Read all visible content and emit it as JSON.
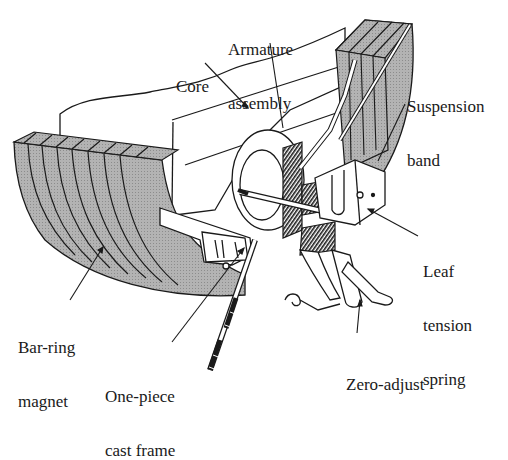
{
  "figure": {
    "colors": {
      "ink": "#1a1a1a",
      "magnet_fill": "#a8a8a8",
      "paper": "#ffffff",
      "frame_fill": "#ffffff"
    }
  },
  "labels": [
    {
      "id": "armature",
      "lines": [
        "Armature",
        "assembly"
      ],
      "x": 228,
      "y": 5,
      "align": "left",
      "leader": {
        "from": [
          270,
          43
        ],
        "to": [
          283,
          128
        ]
      }
    },
    {
      "id": "core",
      "lines": [
        "Core"
      ],
      "x": 176,
      "y": 42,
      "align": "left",
      "leader": {
        "from": [
          205,
          63
        ],
        "to": [
          248,
          108
        ]
      }
    },
    {
      "id": "suspension",
      "lines": [
        "Suspension",
        "band"
      ],
      "x": 407,
      "y": 62,
      "align": "left",
      "leader": {
        "from": [
          405,
          104
        ],
        "to": [
          378,
          161
        ]
      }
    },
    {
      "id": "leaf",
      "lines": [
        "Leaf",
        "tension",
        "spring"
      ],
      "x": 423,
      "y": 227,
      "align": "left",
      "leader": {
        "from": [
          418,
          236
        ],
        "to": [
          368,
          209
        ]
      }
    },
    {
      "id": "barring",
      "lines": [
        "Bar-ring",
        "magnet"
      ],
      "x": 18,
      "y": 303,
      "align": "left",
      "leader": {
        "from": [
          70,
          300
        ],
        "to": [
          103,
          247
        ]
      }
    },
    {
      "id": "frame",
      "lines": [
        "One-piece",
        "cast frame"
      ],
      "x": 105,
      "y": 352,
      "align": "left",
      "leader": {
        "from": [
          172,
          342
        ],
        "to": [
          244,
          248
        ]
      }
    },
    {
      "id": "zero",
      "lines": [
        "Zero-adjust"
      ],
      "x": 346,
      "y": 340,
      "align": "left",
      "leader": {
        "from": [
          357,
          333
        ],
        "to": [
          360,
          300
        ]
      }
    }
  ]
}
